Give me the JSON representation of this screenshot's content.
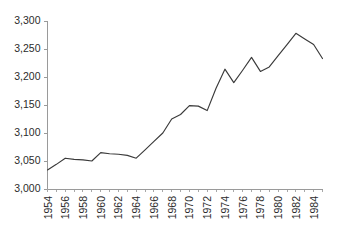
{
  "chart_data": {
    "type": "line",
    "title": "",
    "subtitle": "",
    "xlabel": "",
    "ylabel": "",
    "legend": [],
    "legend_position": "none",
    "grid": false,
    "xlim": [
      1954,
      1985
    ],
    "ylim": [
      3000,
      3300
    ],
    "y_ticks": [
      3000,
      3050,
      3100,
      3150,
      3200,
      3250,
      3300
    ],
    "y_tick_labels": [
      "3,000",
      "3,050",
      "3,100",
      "3,150",
      "3,200",
      "3,250",
      "3,300"
    ],
    "x_ticks": [
      1954,
      1956,
      1958,
      1960,
      1962,
      1964,
      1966,
      1968,
      1970,
      1972,
      1974,
      1976,
      1978,
      1980,
      1982,
      1984
    ],
    "x_tick_labels": [
      "1954",
      "1956",
      "1958",
      "1960",
      "1962",
      "1964",
      "1966",
      "1968",
      "1970",
      "1972",
      "1974",
      "1976",
      "1978",
      "1980",
      "1982",
      "1984"
    ],
    "x_minor_tick_interval": 1,
    "x_label_rotation": -90,
    "line_color": "#3a3a3a",
    "axis_color": "#9a9a9a",
    "background_color": "#ffffff",
    "x": [
      1954,
      1955,
      1956,
      1957,
      1958,
      1959,
      1960,
      1961,
      1962,
      1963,
      1964,
      1965,
      1966,
      1967,
      1968,
      1969,
      1970,
      1971,
      1972,
      1973,
      1974,
      1975,
      1976,
      1977,
      1978,
      1979,
      1980,
      1981,
      1982,
      1983,
      1984,
      1985
    ],
    "values": [
      3034,
      3044,
      3055,
      3053,
      3052,
      3050,
      3065,
      3063,
      3062,
      3060,
      3055,
      3070,
      3085,
      3100,
      3125,
      3133,
      3149,
      3148,
      3140,
      3180,
      3214,
      3190,
      3212,
      3235,
      3210,
      3218,
      3238,
      3258,
      3278,
      3268,
      3258,
      3233
    ],
    "series": [
      {
        "name": "series-1",
        "values": [
          3034,
          3044,
          3055,
          3053,
          3052,
          3050,
          3065,
          3063,
          3062,
          3060,
          3055,
          3070,
          3085,
          3100,
          3125,
          3133,
          3149,
          3148,
          3140,
          3180,
          3214,
          3190,
          3212,
          3235,
          3210,
          3218,
          3238,
          3258,
          3278,
          3268,
          3258,
          3233
        ]
      }
    ]
  }
}
